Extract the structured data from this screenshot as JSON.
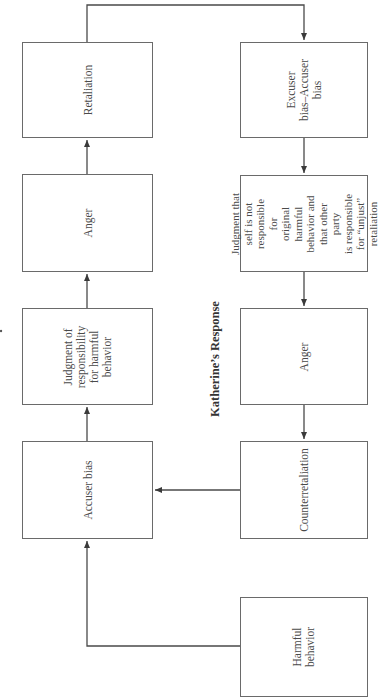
{
  "diagram": {
    "orientation": "rotated -90deg (reads bottom-to-top)",
    "titles": {
      "katherine": "Katherine’s Response"
    },
    "left_chain": [
      {
        "id": "retaliation",
        "label": "Retaliation"
      },
      {
        "id": "anger_left",
        "label": "Anger"
      },
      {
        "id": "judgment_responsibility",
        "label": "Judgment of\nresponsibility\nfor harmful\nbehavior"
      },
      {
        "id": "accuser_bias",
        "label": "Accuser bias"
      }
    ],
    "right_chain": [
      {
        "id": "excuser_accuser_bias",
        "label": "Excuser\nbias–Accuser\nbias"
      },
      {
        "id": "judgment_self",
        "label": "Judgment that\nself is not\nresponsible for\noriginal harmful\nbehavior and\nthat other party\nis responsible\nfor “unjust”\nretaliation"
      },
      {
        "id": "anger_right",
        "label": "Anger"
      },
      {
        "id": "counterretaliation",
        "label": "Counterretaliation"
      },
      {
        "id": "harmful_behavior",
        "label": "Harmful\nbehavior"
      }
    ],
    "edges": [
      {
        "from": "harmful_behavior",
        "to": "accuser_bias"
      },
      {
        "from": "accuser_bias",
        "to": "judgment_responsibility"
      },
      {
        "from": "judgment_responsibility",
        "to": "anger_left"
      },
      {
        "from": "anger_left",
        "to": "retaliation"
      },
      {
        "from": "retaliation",
        "to": "excuser_accuser_bias"
      },
      {
        "from": "excuser_accuser_bias",
        "to": "judgment_self"
      },
      {
        "from": "judgment_self",
        "to": "anger_right"
      },
      {
        "from": "anger_right",
        "to": "counterretaliation"
      },
      {
        "from": "counterretaliation",
        "to": "accuser_bias"
      }
    ],
    "colors": {
      "line": "#4a4a4a",
      "box_border": "#6a6a6a",
      "text": "#4a4a4a"
    }
  }
}
